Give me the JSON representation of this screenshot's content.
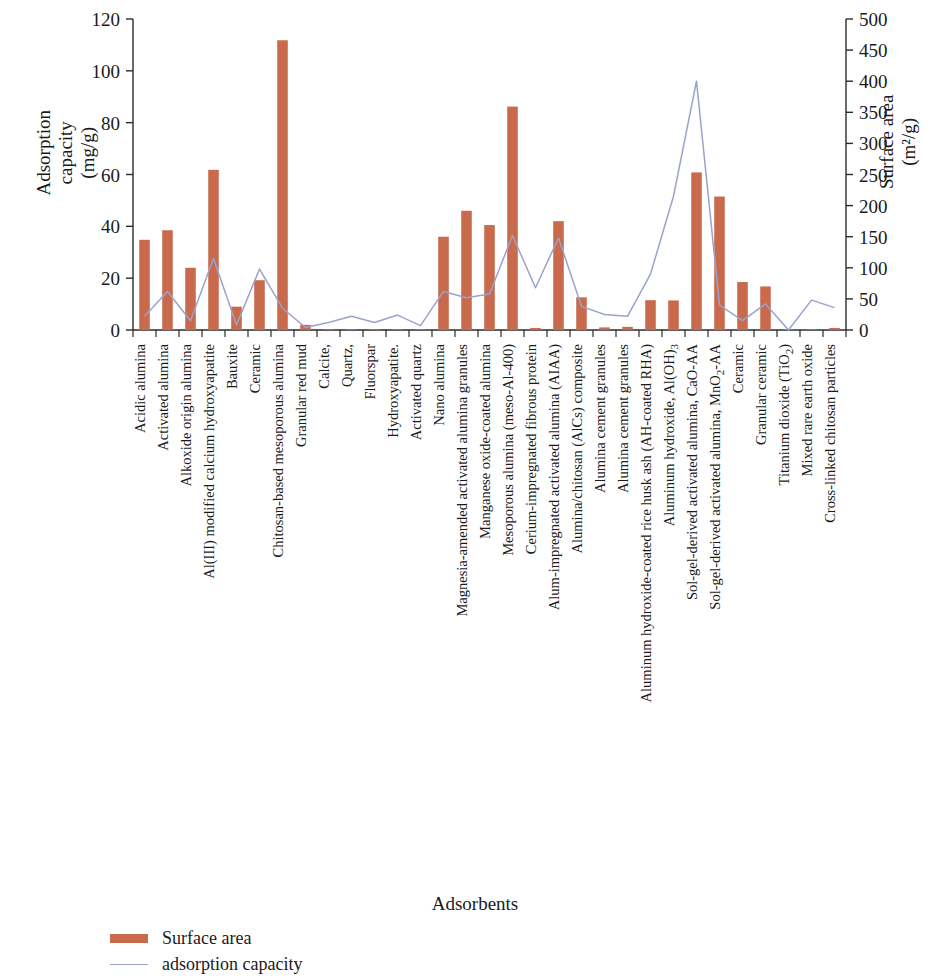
{
  "axes": {
    "left_title_line1": "Adsorption",
    "left_title_line2": "capacity",
    "left_title_line3": "(mg/g)",
    "right_title_line1": "Surface area",
    "right_title_line2": "(m²/g)",
    "x_title": "Adsorbents"
  },
  "legend": {
    "items": [
      {
        "label": "Surface area",
        "type": "bar",
        "color": "#c96a4d"
      },
      {
        "label": "adsorption capacity",
        "type": "line",
        "color": "#9aa3cc"
      }
    ]
  },
  "chart_data": {
    "type": "bar",
    "title": "",
    "xlabel": "Adsorbents",
    "ylabel": "Adsorption capacity (mg/g)",
    "y2label": "Surface area (m²/g)",
    "ylim": [
      0,
      120
    ],
    "y2lim": [
      0,
      500
    ],
    "yticks": [
      0,
      20,
      40,
      60,
      80,
      100,
      120
    ],
    "y2ticks": [
      0,
      50,
      100,
      150,
      200,
      250,
      300,
      350,
      400,
      450,
      500
    ],
    "grid": false,
    "legend_position": "bottom-left",
    "categories": [
      "Acidic alumina",
      "Activated alumina",
      "Alkoxide origin alumina",
      "Al(III) modified calcium hydroxyapatite",
      "Bauxite",
      "Ceramic",
      "Chitosan-based mesoporous alumina",
      "Granular red mud",
      "Calcite,",
      "Quartz,",
      "Fluorspar",
      "Hydroxyapatite.",
      "Activated quartz",
      "Nano alumina",
      "Magnesia-amended activated alumina granules",
      "Manganese oxide-coated alumina",
      "Mesoporous alumina (meso-Al-400)",
      "Cerium-impregnated fibrous protein",
      "Alum-impregnated activated alumina (AIAA)",
      "Alumina/chitosan (AlCs) composite",
      "Alumina cement granules",
      "Alumina cement granules",
      "Aluminum hydroxide-coated rice husk ash (AH-coated RHA)",
      "Aluminum hydroxide, Al(OH)3",
      "Sol-gel-derived activated alumina, CaO-AA",
      "Sol-gel-derived activated alumina, MnO2-AA",
      "Ceramic",
      "Granular ceramic",
      "Titanium dioxide (TiO2)",
      "Mixed rare earth oxide",
      "Cross-linked chitosan particles"
    ],
    "series": [
      {
        "name": "Surface area",
        "axis": "left",
        "units": "mg/g",
        "render": "bar",
        "color": "#c96a4d",
        "values": [
          34.8,
          38.5,
          24.0,
          61.8,
          9.0,
          19.2,
          111.8,
          2.0,
          0.2,
          0.2,
          0.2,
          0.2,
          0.3,
          36.0,
          46.0,
          40.5,
          86.2,
          0.8,
          42.0,
          12.6,
          1.0,
          1.2,
          11.5,
          11.4,
          60.8,
          51.5,
          18.5,
          16.8,
          0.2,
          0.3,
          0.8
        ]
      },
      {
        "name": "adsorption capacity",
        "axis": "right",
        "units": "m²/g",
        "render": "line",
        "color": "#9aa3cc",
        "values": [
          22,
          62,
          15,
          115,
          8,
          98,
          35,
          4,
          12,
          22,
          12,
          24,
          7,
          62,
          52,
          58,
          152,
          68,
          148,
          38,
          25,
          22,
          90,
          215,
          400,
          40,
          15,
          42,
          0,
          48,
          36
        ]
      }
    ]
  }
}
